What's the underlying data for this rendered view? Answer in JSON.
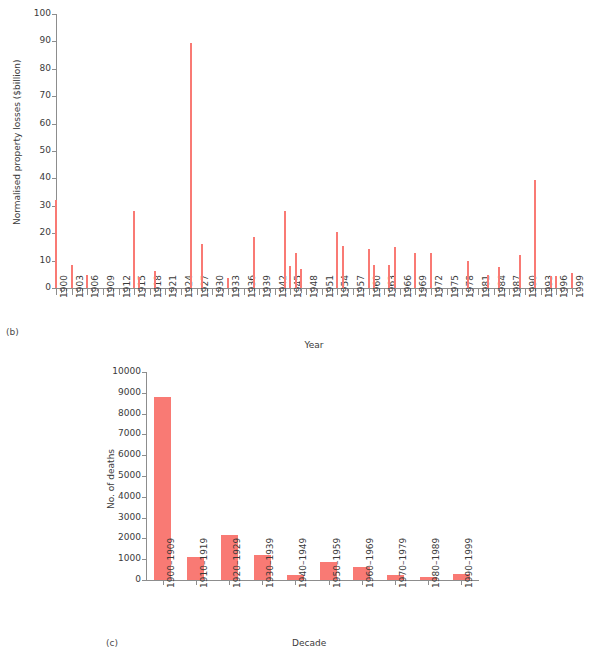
{
  "figure": {
    "panels": [
      {
        "id": "b",
        "panel_label": "(b)",
        "xlabel": "Year",
        "ylabel": "Normalised property losses ($billion)"
      },
      {
        "id": "c",
        "panel_label": "(c)",
        "xlabel": "Decade",
        "ylabel": "No. of deaths"
      }
    ]
  },
  "colors": {
    "bar": "#f97a74",
    "axis": "#8d8d8d",
    "text": "#3a3a3a"
  },
  "chart_data": [
    {
      "type": "bar",
      "id": "b",
      "title": "",
      "xlabel": "Year",
      "ylabel": "Normalised property losses ($billion)",
      "ylim": [
        0,
        100
      ],
      "yticks": [
        0,
        10,
        20,
        30,
        40,
        50,
        60,
        70,
        80,
        90,
        100
      ],
      "ytick_labels": [
        "0",
        "10",
        "20",
        "30",
        "40",
        "50",
        "60",
        "70",
        "80",
        "90",
        "100"
      ],
      "xlim": [
        1900,
        2000
      ],
      "xtick_labels": [
        "1900",
        "1903",
        "1906",
        "1909",
        "1912",
        "1915",
        "1918",
        "1921",
        "1924",
        "1927",
        "1930",
        "1933",
        "1936",
        "1939",
        "1942",
        "1945",
        "1948",
        "1951",
        "1954",
        "1957",
        "1960",
        "1963",
        "1966",
        "1969",
        "1972",
        "1975",
        "1978",
        "1981",
        "1984",
        "1987",
        "1990",
        "1993",
        "1996",
        "1999"
      ],
      "xtick_values": [
        1900,
        1903,
        1906,
        1909,
        1912,
        1915,
        1918,
        1921,
        1924,
        1927,
        1930,
        1933,
        1936,
        1939,
        1942,
        1945,
        1948,
        1951,
        1954,
        1957,
        1960,
        1963,
        1966,
        1969,
        1972,
        1975,
        1978,
        1981,
        1984,
        1987,
        1990,
        1993,
        1996,
        1999
      ],
      "grid": false,
      "legend": false,
      "x": [
        1900,
        1903,
        1906,
        1915,
        1916,
        1919,
        1926,
        1928,
        1933,
        1938,
        1944,
        1945,
        1946,
        1947,
        1954,
        1955,
        1960,
        1961,
        1964,
        1965,
        1969,
        1972,
        1979,
        1983,
        1985,
        1989,
        1992,
        1995,
        1996,
        1999
      ],
      "values": [
        32.0,
        8.3,
        4.8,
        28.2,
        4.0,
        6.1,
        89.3,
        16.1,
        3.8,
        18.6,
        28.1,
        8.2,
        12.6,
        7.1,
        20.6,
        15.4,
        14.1,
        8.3,
        8.4,
        14.8,
        12.8,
        12.8,
        9.9,
        4.6,
        7.5,
        12.0,
        39.5,
        4.2,
        4.2,
        5.3
      ]
    },
    {
      "type": "bar",
      "id": "c",
      "title": "",
      "xlabel": "Decade",
      "ylabel": "No. of deaths",
      "ylim": [
        0,
        10000
      ],
      "yticks": [
        0,
        1000,
        2000,
        3000,
        4000,
        5000,
        6000,
        7000,
        8000,
        9000,
        10000
      ],
      "ytick_labels": [
        "0",
        "1000",
        "2000",
        "3000",
        "4000",
        "5000",
        "6000",
        "7000",
        "8000",
        "9000",
        "10000"
      ],
      "categories": [
        "1900–1909",
        "1910–1919",
        "1920–1929",
        "1930–1939",
        "1940–1949",
        "1950–1959",
        "1960–1969",
        "1970–1979",
        "1980–1989",
        "1990–1999"
      ],
      "values": [
        8800,
        1100,
        2180,
        1210,
        250,
        880,
        620,
        250,
        160,
        300
      ],
      "grid": false,
      "legend": false
    }
  ]
}
